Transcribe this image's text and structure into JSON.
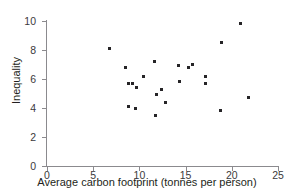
{
  "chart_data": {
    "type": "scatter",
    "title": "",
    "xlabel": "Average carbon footprint (tonnes per person)",
    "ylabel": "Inequality",
    "xlim": [
      0,
      25
    ],
    "ylim": [
      0,
      10
    ],
    "xticks": [
      0,
      5,
      10,
      15,
      20,
      25
    ],
    "yticks": [
      0,
      2,
      4,
      6,
      8,
      10
    ],
    "xtick_labels": [
      "0",
      "5",
      "10",
      "15",
      "20",
      "25"
    ],
    "ytick_labels": [
      "0",
      "2",
      "4",
      "6",
      "8",
      "10"
    ],
    "grid": false,
    "legend": null,
    "marker_color": "#262427",
    "axis_color": "#8b8a8e",
    "background_color": "#ffffff",
    "points": [
      {
        "x": 6.8,
        "y": 8.1
      },
      {
        "x": 8.5,
        "y": 6.8
      },
      {
        "x": 8.8,
        "y": 5.7
      },
      {
        "x": 9.2,
        "y": 5.7
      },
      {
        "x": 8.8,
        "y": 4.1
      },
      {
        "x": 9.6,
        "y": 4.0
      },
      {
        "x": 9.7,
        "y": 5.4
      },
      {
        "x": 10.4,
        "y": 6.2
      },
      {
        "x": 11.6,
        "y": 7.2
      },
      {
        "x": 11.7,
        "y": 3.5
      },
      {
        "x": 11.9,
        "y": 4.9
      },
      {
        "x": 12.4,
        "y": 5.3
      },
      {
        "x": 12.8,
        "y": 4.4
      },
      {
        "x": 14.2,
        "y": 6.9
      },
      {
        "x": 14.3,
        "y": 5.8
      },
      {
        "x": 15.3,
        "y": 6.8
      },
      {
        "x": 15.7,
        "y": 7.0
      },
      {
        "x": 17.1,
        "y": 6.2
      },
      {
        "x": 17.2,
        "y": 5.7
      },
      {
        "x": 18.8,
        "y": 3.8
      },
      {
        "x": 18.9,
        "y": 8.5
      },
      {
        "x": 20.9,
        "y": 9.8
      },
      {
        "x": 21.8,
        "y": 4.7
      }
    ]
  }
}
